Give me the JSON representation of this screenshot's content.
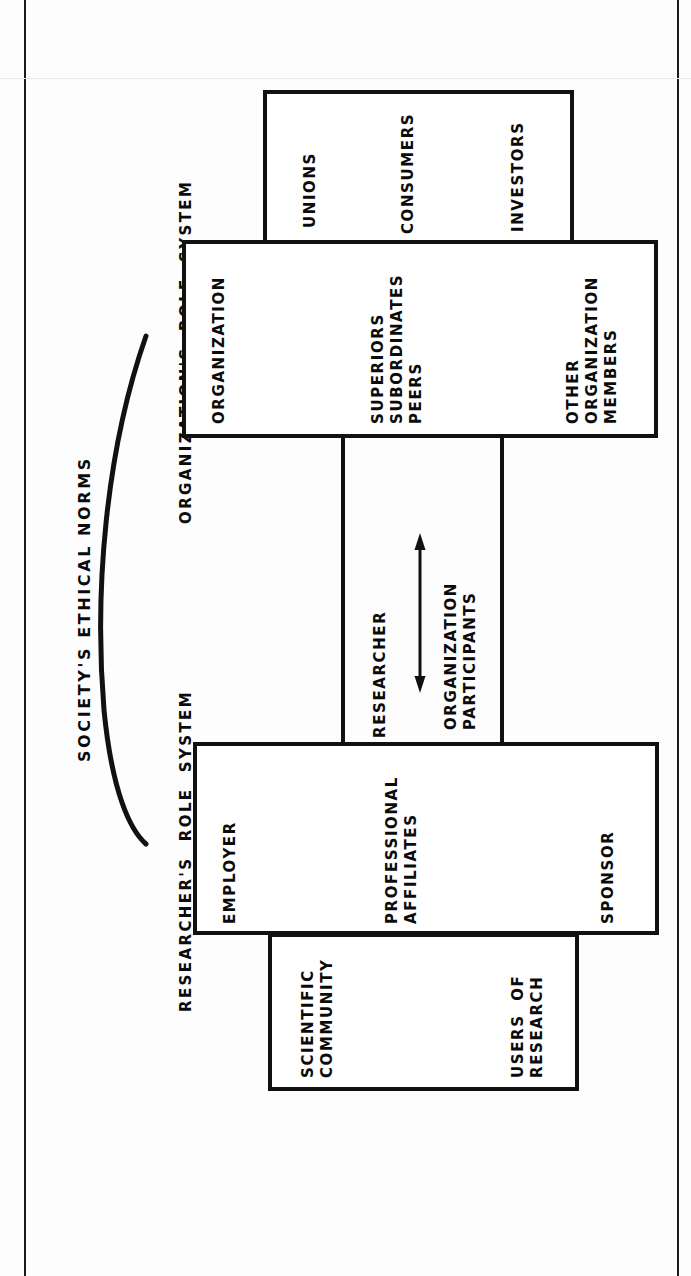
{
  "figure": {
    "heading": "SOCIETY'S ETHICAL NORMS",
    "axis_labels": {
      "organization_role_system": "ORGANIZATION'S  ROLE  SYSTEM",
      "researcher_role_system": "RESEARCHER'S  ROLE  SYSTEM"
    },
    "center_labels": {
      "researcher": "RESEARCHER",
      "organization_participants_line1": "ORGANIZATION",
      "organization_participants_line2": "PARTICIPANTS"
    },
    "boxes": [
      {
        "id": "externals",
        "name": "organization-externals-box",
        "labels": [
          "UNIONS",
          "CONSUMERS",
          "INVESTORS"
        ]
      },
      {
        "id": "organization",
        "name": "organization-box",
        "labels": [
          "ORGANIZATION",
          "SUPERIORS",
          "SUBORDINATES",
          "PEERS",
          "OTHER",
          "ORGANIZATION",
          "MEMBERS"
        ]
      },
      {
        "id": "employer",
        "name": "employer-box",
        "labels": [
          "EMPLOYER",
          "PROFESSIONAL",
          "AFFILIATES",
          "SPONSOR"
        ]
      },
      {
        "id": "scientific",
        "name": "scientific-community-box",
        "labels": [
          "SCIENTIFIC",
          "COMMUNITY",
          "USERS  OF",
          "RESEARCH"
        ]
      }
    ],
    "labels": {
      "unions": "UNIONS",
      "consumers": "CONSUMERS",
      "investors": "INVESTORS",
      "organization": "ORGANIZATION",
      "superiors": "SUPERIORS",
      "subordinates": "SUBORDINATES",
      "peers": "PEERS",
      "other": "OTHER",
      "organization2": "ORGANIZATION",
      "members": "MEMBERS",
      "employer": "EMPLOYER",
      "professional": "PROFESSIONAL",
      "affiliates": "AFFILIATES",
      "sponsor": "SPONSOR",
      "scientific": "SCIENTIFIC",
      "community": "COMMUNITY",
      "users_of": "USERS  OF",
      "research": "RESEARCH"
    },
    "colors": {
      "ink": "#111111",
      "paper": "#fdfdfd"
    }
  }
}
